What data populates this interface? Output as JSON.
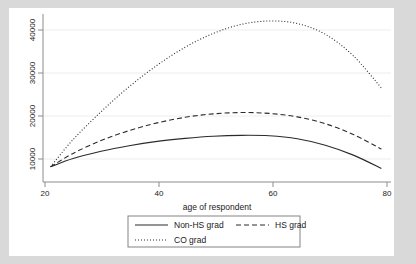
{
  "chart": {
    "type": "line",
    "title": "",
    "xlabel": "age of respondent",
    "ylabel": "",
    "xticks": [
      20,
      40,
      60,
      80
    ],
    "yticks": [
      10000,
      20000,
      30000,
      40000
    ],
    "xlim": [
      20,
      81
    ],
    "ylim": [
      5500,
      43500
    ],
    "grid": "horizontal",
    "legend_position": "below-axis",
    "legend": {
      "entries": [
        {
          "label": "Non-HS grad",
          "style": "solid"
        },
        {
          "label": "HS grad",
          "style": "dashed"
        },
        {
          "label": "CO grad",
          "style": "dotted"
        }
      ]
    }
  },
  "chart_data": {
    "type": "line",
    "title": "",
    "xlabel": "age of respondent",
    "ylabel": "",
    "xlim": [
      20,
      81
    ],
    "ylim": [
      5500,
      43500
    ],
    "xticks": [
      20,
      40,
      60,
      80
    ],
    "yticks": [
      10000,
      20000,
      30000,
      40000
    ],
    "grid": "horizontal gridlines only",
    "legend": [
      "Non-HS grad",
      "HS grad",
      "CO grad"
    ],
    "legend_position": "below x-axis, boxed",
    "x": [
      21,
      25,
      30,
      35,
      40,
      45,
      50,
      55,
      60,
      65,
      70,
      75,
      80
    ],
    "series": [
      {
        "name": "Non-HS grad",
        "style": "solid",
        "values": [
          8200,
          10100,
          11800,
          13100,
          14100,
          14800,
          15300,
          15500,
          15400,
          14700,
          13200,
          10900,
          7800
        ]
      },
      {
        "name": "HS grad",
        "style": "dashed",
        "values": [
          8200,
          11300,
          14300,
          16600,
          18400,
          19700,
          20500,
          20800,
          20600,
          19800,
          18200,
          15700,
          12300
        ]
      },
      {
        "name": "CO grad",
        "style": "dotted",
        "values": [
          8200,
          14500,
          21000,
          26800,
          31800,
          36000,
          39200,
          41300,
          42100,
          41500,
          39000,
          34000,
          26500
        ]
      }
    ]
  },
  "labels": {
    "x_20": "20",
    "x_40": "40",
    "x_60": "60",
    "x_80": "80",
    "y_10000": "10000",
    "y_20000": "20000",
    "y_30000": "30000",
    "y_40000": "40000",
    "xaxis_title": "age of respondent",
    "legend_1": "Non-HS grad",
    "legend_2": "HS grad",
    "legend_3": "CO grad"
  }
}
